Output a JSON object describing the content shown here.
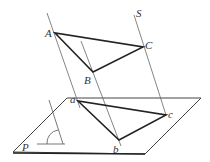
{
  "diagram": {
    "plane_label": "P",
    "direction_label": "S",
    "points": {
      "A": {
        "label": "A",
        "x": 55,
        "y": 33
      },
      "B": {
        "label": "B",
        "x": 93,
        "y": 72
      },
      "C": {
        "label": "C",
        "x": 143,
        "y": 47
      },
      "a": {
        "label": "a",
        "x": 78,
        "y": 101
      },
      "b": {
        "label": "b",
        "x": 119,
        "y": 140
      },
      "c": {
        "label": "c",
        "x": 166,
        "y": 115
      }
    },
    "colors": {
      "triangle": "#222222",
      "thin": "#555555",
      "text": "#333333"
    }
  }
}
